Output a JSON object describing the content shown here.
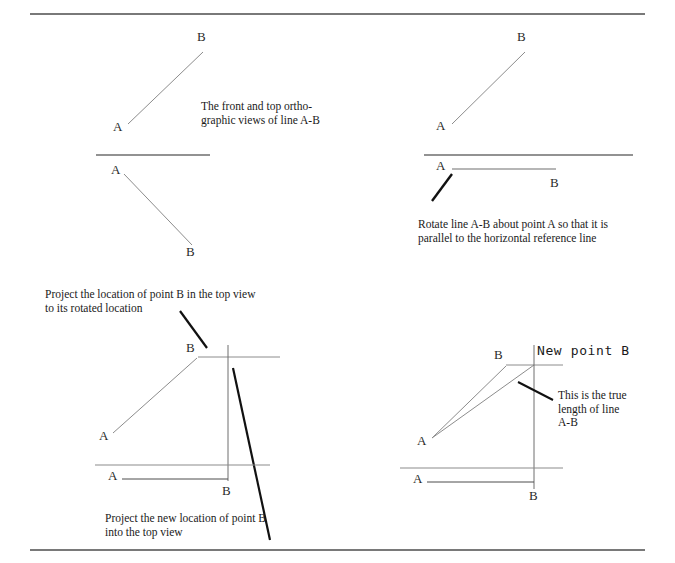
{
  "figure": {
    "page_width": 675,
    "page_height": 563,
    "colors": {
      "background": "#ffffff",
      "border_rule": "#4d4d4d",
      "construction_line": "#8c8c8c",
      "object_line": "#6e6e6e",
      "heavy_line": "#111111",
      "text": "#1a1a1a"
    },
    "borders": {
      "top_rule": {
        "x1": 30,
        "y1": 14,
        "x2": 645,
        "y2": 14
      },
      "bottom_rule": {
        "x1": 30,
        "y1": 550,
        "x2": 645,
        "y2": 550
      }
    }
  },
  "step1": {
    "caption": "The front and top ortho-\ngraphic views of line A-B",
    "front_view": {
      "line": {
        "x1": 128,
        "y1": 124,
        "x2": 203,
        "y2": 52
      },
      "label_a": "A",
      "label_b": "B",
      "label_a_pos": {
        "x": 113,
        "y": 120
      },
      "label_b_pos": {
        "x": 197,
        "y": 30
      }
    },
    "reference_line": {
      "x1": 96,
      "y1": 155,
      "x2": 210,
      "y2": 155
    },
    "top_view": {
      "line": {
        "x1": 124,
        "y1": 174,
        "x2": 192,
        "y2": 245
      },
      "label_a": "A",
      "label_b": "B",
      "label_a_pos": {
        "x": 111,
        "y": 163
      },
      "label_b_pos": {
        "x": 186,
        "y": 245
      }
    }
  },
  "step2": {
    "caption": "Rotate line A-B about point A so that it is\nparallel to the horizontal reference line",
    "caption_pos": {
      "x": 418,
      "y": 218
    },
    "front_view": {
      "line": {
        "x1": 452,
        "y1": 124,
        "x2": 525,
        "y2": 52
      },
      "label_a": "A",
      "label_b": "B",
      "label_a_pos": {
        "x": 436,
        "y": 119
      },
      "label_b_pos": {
        "x": 517,
        "y": 30
      }
    },
    "reference_line": {
      "x1": 424,
      "y1": 155,
      "x2": 633,
      "y2": 155
    },
    "top_view": {
      "rotated_line": {
        "x1": 452,
        "y1": 169,
        "x2": 556,
        "y2": 169
      },
      "swing_arc": {
        "x1": 432,
        "y1": 201,
        "x2": 452,
        "y2": 174
      },
      "label_a": "A",
      "label_b": "B",
      "label_a_pos": {
        "x": 436,
        "y": 159
      },
      "label_b_pos": {
        "x": 550,
        "y": 176
      }
    }
  },
  "step3": {
    "caption_top": "Project the location of point B in the top view\nto its rotated location",
    "caption_top_pos": {
      "x": 45,
      "y": 288
    },
    "caption_bottom": "Project the new location of point B\ninto the top view",
    "caption_bottom_pos": {
      "x": 105,
      "y": 512
    },
    "leader_top": {
      "x1": 180,
      "y1": 311,
      "x2": 207,
      "y2": 348
    },
    "leader_bottom": {
      "x1": 233,
      "y1": 368,
      "x2": 270,
      "y2": 540
    },
    "front_view": {
      "line": {
        "x1": 113,
        "y1": 433,
        "x2": 197,
        "y2": 358
      },
      "horizontal_projector": {
        "x1": 198,
        "y1": 357,
        "x2": 280,
        "y2": 357
      },
      "label_a": "A",
      "label_b": "B",
      "label_a_pos": {
        "x": 99,
        "y": 429
      },
      "label_b_pos": {
        "x": 186,
        "y": 341
      }
    },
    "vertical_projector": {
      "x1": 228,
      "y1": 345,
      "x2": 228,
      "y2": 481
    },
    "reference_line": {
      "x1": 95,
      "y1": 465,
      "x2": 270,
      "y2": 465
    },
    "top_view": {
      "line": {
        "x1": 122,
        "y1": 479,
        "x2": 228,
        "y2": 479
      },
      "label_a": "A",
      "label_b": "B",
      "label_a_pos": {
        "x": 108,
        "y": 469
      },
      "label_b_pos": {
        "x": 222,
        "y": 484
      }
    }
  },
  "step4": {
    "new_point_label": "New point B",
    "new_point_label_pos": {
      "x": 537,
      "y": 344
    },
    "caption": "This is the true\nlength of line\nA-B",
    "caption_pos": {
      "x": 558,
      "y": 389
    },
    "leader": {
      "x1": 518,
      "y1": 382,
      "x2": 553,
      "y2": 400
    },
    "front_view": {
      "original_line": {
        "x1": 432,
        "y1": 438,
        "x2": 506,
        "y2": 366
      },
      "true_length_line": {
        "x1": 432,
        "y1": 438,
        "x2": 534,
        "y2": 365
      },
      "horizontal_projector": {
        "x1": 506,
        "y1": 365,
        "x2": 563,
        "y2": 365
      },
      "label_a": "A",
      "label_b": "B",
      "label_a_pos": {
        "x": 417,
        "y": 434
      },
      "label_b_pos": {
        "x": 494,
        "y": 348
      }
    },
    "vertical_projector": {
      "x1": 534,
      "y1": 345,
      "x2": 534,
      "y2": 489
    },
    "reference_line": {
      "x1": 400,
      "y1": 468,
      "x2": 563,
      "y2": 468
    },
    "top_view": {
      "line": {
        "x1": 427,
        "y1": 482,
        "x2": 534,
        "y2": 482
      },
      "label_a": "A",
      "label_b": "B",
      "label_a_pos": {
        "x": 413,
        "y": 472
      },
      "label_b_pos": {
        "x": 529,
        "y": 489
      }
    }
  }
}
